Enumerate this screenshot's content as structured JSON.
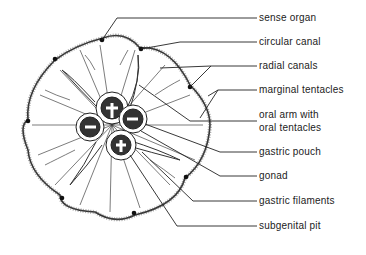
{
  "diagram": {
    "labels": [
      {
        "id": "sense-organ",
        "text": "sense organ",
        "y": 12
      },
      {
        "id": "circular-canal",
        "text": "circular canal",
        "y": 36
      },
      {
        "id": "radial-canals",
        "text": "radial canals",
        "y": 60
      },
      {
        "id": "marginal-tentacles",
        "text": "marginal tentacles",
        "y": 84
      },
      {
        "id": "oral-arm-1",
        "text": "oral arm with",
        "y": 109
      },
      {
        "id": "oral-arm-2",
        "text": "oral tentacles",
        "y": 122
      },
      {
        "id": "gastric-pouch",
        "text": "gastric pouch",
        "y": 146
      },
      {
        "id": "gonad",
        "text": "gonad",
        "y": 170
      },
      {
        "id": "gastric-filaments",
        "text": "gastric filaments",
        "y": 195
      },
      {
        "id": "subgenital-pit",
        "text": "subgenital pit",
        "y": 220
      }
    ]
  }
}
